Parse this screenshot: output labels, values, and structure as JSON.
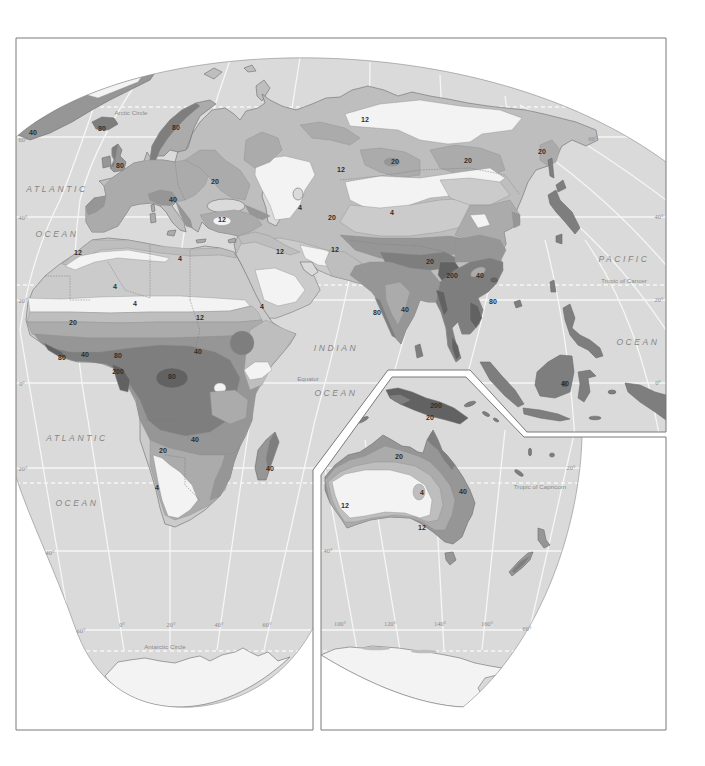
{
  "map": {
    "colors": {
      "ocean": "#dadada",
      "zone_lt4": "#f3f3f3",
      "zone_4": "#cbcbcb",
      "zone_12": "#bebebe",
      "zone_20": "#ababab",
      "zone_40": "#969696",
      "zone_80": "#7e7e7e",
      "zone_200": "#626262",
      "frame": "#7a7a7a",
      "graticule": "#f6f6f6",
      "page": "#ffffff"
    },
    "ocean_labels": [
      "ATLANTIC",
      "OCEAN",
      "ATLANTIC",
      "OCEAN",
      "INDIAN",
      "OCEAN",
      "PACIFIC",
      "OCEAN"
    ],
    "reference_lines": {
      "arctic_circle": "Arctic Circle",
      "tropic_of_cancer": "Tropic of Cancer",
      "equator": "Equator",
      "tropic_of_capricorn": "Tropic of Capricorn",
      "antarctic_circle": "Antarctic Circle"
    },
    "latitude_labels": {
      "left": [
        "60°",
        "40°",
        "20°",
        "0°",
        "20°",
        "40°",
        "60°"
      ],
      "right": [
        "60°",
        "40°",
        "20°",
        "0°"
      ],
      "inset": [
        "20°",
        "40°",
        "60°"
      ]
    },
    "longitude_labels": {
      "main": [
        "0°",
        "20°",
        "40°",
        "60°"
      ],
      "inset": [
        "100°",
        "120°",
        "140°",
        "160°"
      ]
    },
    "zone_labels": [
      "40",
      "80",
      "80",
      "80",
      "20",
      "40",
      "12",
      "12",
      "20",
      "20",
      "12",
      "4",
      "20",
      "4",
      "20",
      "12",
      "4",
      "4",
      "4",
      "12",
      "20",
      "40",
      "80",
      "40",
      "80",
      "200",
      "80",
      "40",
      "20",
      "4",
      "40",
      "12",
      "4",
      "12",
      "20",
      "200",
      "80",
      "40",
      "200",
      "20",
      "40",
      "80",
      "40",
      "20",
      "4",
      "12",
      "40",
      "12"
    ]
  }
}
